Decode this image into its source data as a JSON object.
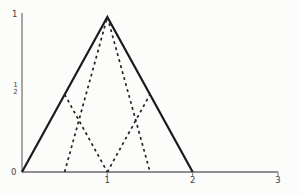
{
  "chart_data": {
    "type": "line",
    "title": "",
    "xlabel": "",
    "ylabel": "",
    "xlim": [
      0,
      3
    ],
    "ylim": [
      0,
      1
    ],
    "grid": false,
    "legend": "none",
    "x_ticks": [
      {
        "value": 1,
        "label": "1"
      },
      {
        "value": 2,
        "label": "2"
      },
      {
        "value": 3,
        "label": "3"
      }
    ],
    "y_ticks": [
      {
        "value": 0,
        "label": "0"
      },
      {
        "value": 0.5,
        "label": "1/2"
      },
      {
        "value": 1,
        "label": "1"
      }
    ],
    "series": [
      {
        "name": "hat-function-solid",
        "linestyle": "solid",
        "points": [
          [
            0,
            0
          ],
          [
            1,
            1
          ],
          [
            2,
            0
          ]
        ]
      },
      {
        "name": "center-refined-hat-dashed",
        "linestyle": "dashed",
        "points": [
          [
            0.5,
            0
          ],
          [
            1,
            1
          ],
          [
            1.5,
            0
          ]
        ]
      },
      {
        "name": "left-half-hat-descending-dashed",
        "linestyle": "dashed",
        "points": [
          [
            0.5,
            0.5
          ],
          [
            1,
            0
          ]
        ]
      },
      {
        "name": "right-half-hat-ascending-dashed",
        "linestyle": "dashed",
        "points": [
          [
            1,
            0
          ],
          [
            1.5,
            0.5
          ]
        ]
      }
    ]
  },
  "labels": {
    "y_one": "1",
    "y_half_numerator": "1",
    "y_half_denominator": "2",
    "y_zero": "0"
  },
  "colors": {
    "solid_line": "#1a1a1a",
    "dashed_line": "#222222",
    "axis": "#8f8f8f",
    "text": "#3f3f3f",
    "background": "#fcfcfb"
  }
}
